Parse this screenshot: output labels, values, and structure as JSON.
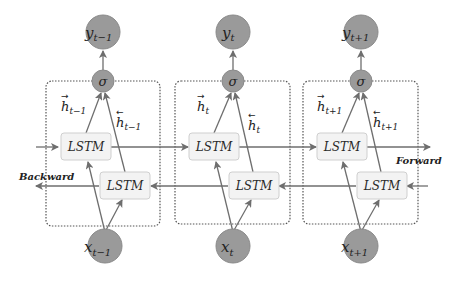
{
  "diagram": {
    "type": "bidirectional-lstm",
    "colors": {
      "node_fill": "#9a9a9a",
      "node_stroke": "#7a7a7a",
      "lstm_fill": "#f3f3f3",
      "lstm_stroke": "#cfcfcf",
      "arrow": "#6e6e6e",
      "box_border": "#555555"
    },
    "direction_labels": {
      "forward": "Forward",
      "backward": "Backward"
    },
    "timesteps": [
      {
        "output": "y",
        "output_sub": "t−1",
        "activation": "σ",
        "forward_lstm": "LSTM",
        "backward_lstm": "LSTM",
        "forward_hidden": "h",
        "forward_hidden_sub": "t−1",
        "backward_hidden": "h",
        "backward_hidden_sub": "t−1",
        "input": "x",
        "input_sub": "t−1"
      },
      {
        "output": "y",
        "output_sub": "t",
        "activation": "σ",
        "forward_lstm": "LSTM",
        "backward_lstm": "LSTM",
        "forward_hidden": "h",
        "forward_hidden_sub": "t",
        "backward_hidden": "h",
        "backward_hidden_sub": "t",
        "input": "x",
        "input_sub": "t"
      },
      {
        "output": "y",
        "output_sub": "t+1",
        "activation": "σ",
        "forward_lstm": "LSTM",
        "backward_lstm": "LSTM",
        "forward_hidden": "h",
        "forward_hidden_sub": "t+1",
        "backward_hidden": "h",
        "backward_hidden_sub": "t+1",
        "input": "x",
        "input_sub": "t+1"
      }
    ]
  }
}
